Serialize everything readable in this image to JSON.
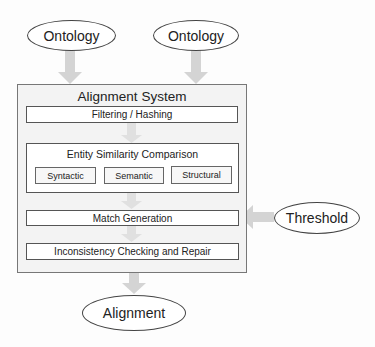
{
  "diagram": {
    "inputs": [
      {
        "label": "Ontology"
      },
      {
        "label": "Ontology"
      }
    ],
    "system": {
      "title": "Alignment System",
      "stages": {
        "filtering": "Filtering / Hashing",
        "entity_similarity": {
          "title": "Entity Similarity Comparison",
          "methods": [
            "Syntactic",
            "Semantic",
            "Structural"
          ]
        },
        "match_generation": "Match Generation",
        "repair": "Inconsistency Checking and Repair"
      }
    },
    "parameter": {
      "label": "Threshold"
    },
    "output": {
      "label": "Alignment"
    },
    "colors": {
      "arrow": "#d6d6d6",
      "inner_arrow": "#e2e2e2",
      "border": "#555555",
      "system_fill": "#f3f3f3"
    }
  }
}
